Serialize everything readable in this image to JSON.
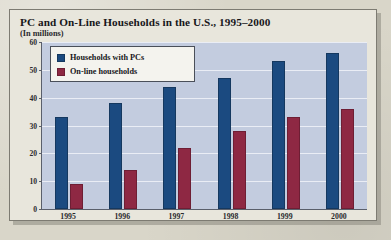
{
  "card": {
    "title": "PC and On-Line Households in the U.S., 1995–2000",
    "subtitle": "(In millions)"
  },
  "legend": {
    "items": [
      {
        "label": "Households with PCs",
        "color": "#1b4a80",
        "swatch_name": "legend-swatch-blue"
      },
      {
        "label": "On-line households",
        "color": "#8e2843",
        "swatch_name": "legend-swatch-red"
      }
    ]
  },
  "axis": {
    "y_ticks": [
      "60",
      "50",
      "40",
      "30",
      "20",
      "10",
      "0"
    ],
    "x_ticks": [
      "1995",
      "1996",
      "1997",
      "1998",
      "1999",
      "2000"
    ]
  },
  "chart_data": {
    "type": "bar",
    "title": "PC and On-Line Households in the U.S., 1995–2000",
    "subtitle": "(In millions)",
    "xlabel": "",
    "ylabel": "In millions",
    "ylim": [
      0,
      60
    ],
    "ytick_step": 10,
    "grid": true,
    "legend_position": "top-left-inside",
    "categories": [
      "1995",
      "1996",
      "1997",
      "1998",
      "1999",
      "2000"
    ],
    "series": [
      {
        "name": "Households with PCs",
        "color": "#1b4a80",
        "values": [
          33,
          38,
          44,
          47,
          53,
          56
        ]
      },
      {
        "name": "On-line households",
        "color": "#8e2843",
        "values": [
          9,
          14,
          22,
          28,
          33,
          36
        ]
      }
    ]
  }
}
